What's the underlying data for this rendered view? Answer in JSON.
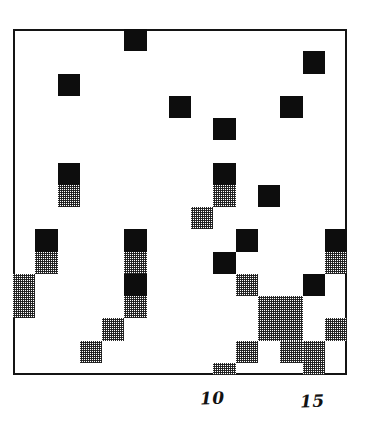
{
  "figure": {
    "name": "scatter-density-grid",
    "background_color": "#ffffff",
    "frame_color": "#141414"
  },
  "axis": {
    "x_tick_labels": [
      {
        "text": "10",
        "x": 200,
        "y": 390
      },
      {
        "text": "15",
        "x": 300,
        "y": 393
      }
    ]
  },
  "chart_data": {
    "type": "heatmap",
    "title": "",
    "subtitle": "",
    "xlabel": "",
    "ylabel": "",
    "xlim": [
      1,
      16
    ],
    "ylim": [
      0,
      15.5
    ],
    "grid": false,
    "legend": null,
    "levels": [
      {
        "level": 0,
        "label": "empty",
        "color": "#ffffff"
      },
      {
        "level": 1,
        "label": "low",
        "color": "#9a9a9a"
      },
      {
        "level": 2,
        "label": "high",
        "color": "#0d0d0d"
      }
    ],
    "x_categories": [
      1,
      2,
      3,
      4,
      5,
      6,
      7,
      8,
      9,
      10,
      11,
      12,
      13,
      14,
      15
    ],
    "n_cols": 15,
    "n_rows": 16,
    "cell_width": 22.27,
    "cell_height": 22.25,
    "origin_x": 13,
    "origin_y": 29,
    "cells": [
      {
        "col": 5,
        "row": 0,
        "level": 2
      },
      {
        "col": 13,
        "row": 1,
        "level": 2
      },
      {
        "col": 2,
        "row": 2,
        "level": 2
      },
      {
        "col": 7,
        "row": 3,
        "level": 2
      },
      {
        "col": 12,
        "row": 3,
        "level": 2
      },
      {
        "col": 9,
        "row": 4,
        "level": 2
      },
      {
        "col": 2,
        "row": 6,
        "level": 2
      },
      {
        "col": 9,
        "row": 6,
        "level": 2
      },
      {
        "col": 2,
        "row": 7,
        "level": 1
      },
      {
        "col": 9,
        "row": 7,
        "level": 1
      },
      {
        "col": 11,
        "row": 7,
        "level": 2
      },
      {
        "col": 8,
        "row": 8,
        "level": 1
      },
      {
        "col": 1,
        "row": 9,
        "level": 2
      },
      {
        "col": 5,
        "row": 9,
        "level": 2
      },
      {
        "col": 10,
        "row": 9,
        "level": 2
      },
      {
        "col": 14,
        "row": 9,
        "level": 2
      },
      {
        "col": 1,
        "row": 10,
        "level": 1
      },
      {
        "col": 5,
        "row": 10,
        "level": 1
      },
      {
        "col": 9,
        "row": 10,
        "level": 2
      },
      {
        "col": 14,
        "row": 10,
        "level": 1
      },
      {
        "col": 0,
        "row": 11,
        "level": 1
      },
      {
        "col": 5,
        "row": 11,
        "level": 2
      },
      {
        "col": 10,
        "row": 11,
        "level": 1
      },
      {
        "col": 13,
        "row": 11,
        "level": 2
      },
      {
        "col": 0,
        "row": 12,
        "level": 1
      },
      {
        "col": 5,
        "row": 12,
        "level": 1
      },
      {
        "col": 11,
        "row": 12,
        "level": 1
      },
      {
        "col": 12,
        "row": 12,
        "level": 1
      },
      {
        "col": 4,
        "row": 13,
        "level": 1
      },
      {
        "col": 11,
        "row": 13,
        "level": 1
      },
      {
        "col": 12,
        "row": 13,
        "level": 1
      },
      {
        "col": 14,
        "row": 13,
        "level": 1
      },
      {
        "col": 3,
        "row": 14,
        "level": 1
      },
      {
        "col": 10,
        "row": 14,
        "level": 1
      },
      {
        "col": 12,
        "row": 14,
        "level": 1
      },
      {
        "col": 13,
        "row": 14,
        "level": 1
      },
      {
        "col": 9,
        "row": 15,
        "level": 1
      },
      {
        "col": 13,
        "row": 15,
        "level": 1
      }
    ]
  }
}
